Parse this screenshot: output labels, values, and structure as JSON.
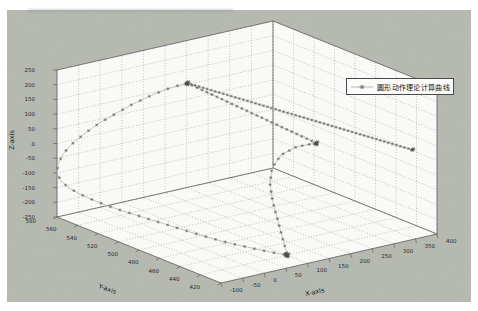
{
  "figure": {
    "background_color": "#b5b9b0",
    "wall_color": "#fcfcfa",
    "grid_color": "#949a92",
    "edge_color": "#4d4d4d",
    "tick_label_color": "#1c1c1c",
    "line_color": "#b4bbb1",
    "marker_color": "#62675f",
    "cluster_color": "#41453f"
  },
  "chart_data": {
    "type": "line3d",
    "title": "",
    "grid": true,
    "legend": {
      "label": "圆形动作理论计算曲线",
      "marker": "*",
      "position": "upper-right-inside"
    },
    "axes": {
      "x": {
        "label": "X-axis",
        "range": [
          -100,
          400
        ],
        "ticks": [
          -100,
          -50,
          0,
          50,
          100,
          150,
          200,
          250,
          300,
          350,
          400
        ]
      },
      "y": {
        "label": "Y-axis",
        "range": [
          420,
          580
        ],
        "ticks": [
          580,
          560,
          540,
          520,
          500,
          480,
          460,
          440,
          420
        ]
      },
      "z": {
        "label": "Z-axis",
        "range": [
          -250,
          250
        ],
        "ticks": [
          250,
          200,
          150,
          100,
          50,
          0,
          -50,
          -100,
          -150,
          -200,
          -250
        ]
      }
    },
    "view": {
      "style": "MATLAB 3-D oblique orthographic view, grid on"
    },
    "projection": {
      "near": [
        221,
        283
      ],
      "xvec": [
        216,
        -49
      ],
      "yvec": [
        -164,
        -66
      ],
      "zvec": [
        0,
        -147
      ]
    },
    "series": [
      {
        "name": "圆形动作理论计算曲线",
        "line_style": "solid",
        "marker": "*"
      }
    ],
    "segments_px": [
      {
        "id": "approach-line",
        "points": [
          [
            187,
            83
          ],
          [
            413,
            150
          ]
        ],
        "marker_spacing": 4.2
      },
      {
        "id": "chord-line",
        "points": [
          [
            187,
            83
          ],
          [
            316,
            143
          ]
        ],
        "marker_spacing": 5.5
      },
      {
        "id": "right-arc",
        "points": [
          [
            316,
            143
          ],
          [
            296,
            147
          ],
          [
            281,
            155
          ],
          [
            272,
            168
          ],
          [
            270,
            184
          ],
          [
            273,
            203
          ],
          [
            278,
            221
          ],
          [
            282,
            236
          ],
          [
            285,
            247
          ],
          [
            287,
            254
          ]
        ],
        "marker_spacing": 7
      },
      {
        "id": "big-arc",
        "points": [
          [
            187,
            83
          ],
          [
            170,
            88
          ],
          [
            152,
            95
          ],
          [
            133,
            104
          ],
          [
            115,
            114
          ],
          [
            98,
            124
          ],
          [
            84,
            134
          ],
          [
            72,
            144
          ],
          [
            63,
            154
          ],
          [
            58,
            164
          ],
          [
            57,
            173
          ],
          [
            61,
            181
          ],
          [
            69,
            188
          ],
          [
            80,
            194
          ],
          [
            93,
            200
          ],
          [
            108,
            206
          ],
          [
            123,
            211
          ],
          [
            139,
            216
          ],
          [
            155,
            221
          ],
          [
            171,
            226
          ],
          [
            187,
            231
          ],
          [
            203,
            236
          ],
          [
            218,
            240
          ],
          [
            233,
            244
          ],
          [
            247,
            247
          ],
          [
            260,
            250
          ],
          [
            271,
            252
          ],
          [
            280,
            254
          ],
          [
            287,
            255
          ]
        ],
        "marker_spacing": 10
      }
    ],
    "clusters_px": [
      {
        "center": [
          187,
          83
        ],
        "count": 4
      },
      {
        "center": [
          316,
          143
        ],
        "count": 4
      },
      {
        "center": [
          287,
          255
        ],
        "count": 5
      },
      {
        "center": [
          412,
          150
        ],
        "count": 2
      }
    ]
  }
}
